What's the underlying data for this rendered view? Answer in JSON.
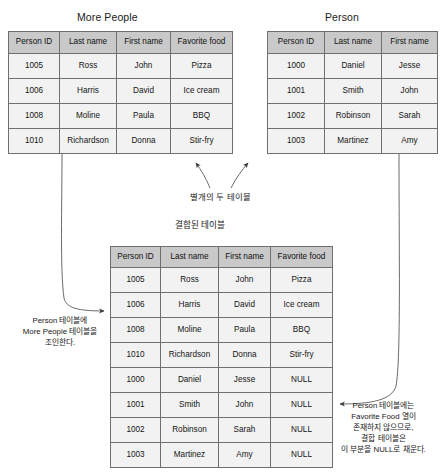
{
  "diagram": {
    "kind": "sql-join-illustration",
    "labels": {
      "separate_tables": "별개의 두 테이블",
      "joined_table_caption": "결합된 테이블"
    },
    "annotations": {
      "left": "Person 테이블에\nMore People 테이블을\n조인한다.",
      "right": "Person 테이블에는\nFavorite Food 열이\n존재하지 않으므로,\n결합 테이블은\n이 부분을 NULL로 채운다."
    }
  },
  "tables": {
    "more_people": {
      "title": "More People",
      "columns": [
        "Person ID",
        "Last name",
        "First name",
        "Favorite food"
      ],
      "rows": [
        [
          "1005",
          "Ross",
          "John",
          "Pizza"
        ],
        [
          "1006",
          "Harris",
          "David",
          "Ice cream"
        ],
        [
          "1008",
          "Moline",
          "Paula",
          "BBQ"
        ],
        [
          "1010",
          "Richardson",
          "Donna",
          "Stir-fry"
        ]
      ]
    },
    "person": {
      "title": "Person",
      "columns": [
        "Person ID",
        "Last name",
        "First name"
      ],
      "rows": [
        [
          "1000",
          "Daniel",
          "Jesse"
        ],
        [
          "1001",
          "Smith",
          "John"
        ],
        [
          "1002",
          "Robinson",
          "Sarah"
        ],
        [
          "1003",
          "Martinez",
          "Amy"
        ]
      ]
    },
    "joined": {
      "columns": [
        "Person ID",
        "Last name",
        "First name",
        "Favorite food"
      ],
      "rows": [
        [
          "1005",
          "Ross",
          "John",
          "Pizza"
        ],
        [
          "1006",
          "Harris",
          "David",
          "Ice cream"
        ],
        [
          "1008",
          "Moline",
          "Paula",
          "BBQ"
        ],
        [
          "1010",
          "Richardson",
          "Donna",
          "Stir-fry"
        ],
        [
          "1000",
          "Daniel",
          "Jesse",
          "NULL"
        ],
        [
          "1001",
          "Smith",
          "John",
          "NULL"
        ],
        [
          "1002",
          "Robinson",
          "Sarah",
          "NULL"
        ],
        [
          "1003",
          "Martinez",
          "Amy",
          "NULL"
        ]
      ]
    }
  },
  "colors": {
    "header_fill": "#c9c9c9",
    "cell_fill": "#f2f2f2",
    "border": "#6f6f6f",
    "arrow": "#3a3a3a",
    "text": "#141414",
    "background": "#ffffff"
  }
}
